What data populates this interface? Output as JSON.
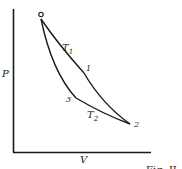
{
  "diagram": {
    "type": "PV cycle diagram",
    "axes": {
      "y_label": "P",
      "x_label": "V"
    },
    "points": [
      {
        "id": "0",
        "label": "o",
        "x": 41,
        "y": 19
      },
      {
        "id": "1",
        "label": "1",
        "x": 84,
        "y": 73
      },
      {
        "id": "2",
        "label": "2",
        "x": 130,
        "y": 124
      },
      {
        "id": "3",
        "label": "3",
        "x": 76,
        "y": 98
      }
    ],
    "curves": [
      {
        "id": "isotherm-T1",
        "label": "T",
        "subscript": "1",
        "from": "0",
        "to": "1"
      },
      {
        "id": "path-1-2",
        "label": "",
        "from": "1",
        "to": "2"
      },
      {
        "id": "isotherm-T2",
        "label": "T",
        "subscript": "2",
        "from": "3",
        "to": "2"
      },
      {
        "id": "path-0-3",
        "label": "",
        "from": "0",
        "to": "3"
      }
    ],
    "caption_fragment": "Fig. II"
  },
  "colors": {
    "ink": "#1a1a1a",
    "background": "#ffffff"
  }
}
